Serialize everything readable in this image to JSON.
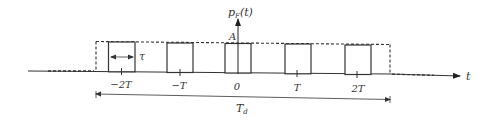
{
  "diagram": {
    "type": "pulse_train",
    "y_axis_label": "p_F(t)",
    "y_axis_label_main": "p",
    "y_axis_label_sub": "F",
    "y_axis_label_arg": "(t)",
    "x_axis_label": "t",
    "amplitude_label": "A",
    "pulse_width_label": "τ",
    "duration_label_main": "T",
    "duration_label_sub": "d",
    "tick_labels": [
      "−2T",
      "−T",
      "0",
      "T",
      "2T"
    ],
    "pulse_centers": [
      "-2T",
      "-T",
      "0",
      "T",
      "2T"
    ],
    "envelope": "dashed rectangle spanning duration T_d",
    "colors": {
      "stroke": "#333333",
      "background": "#ffffff"
    }
  }
}
